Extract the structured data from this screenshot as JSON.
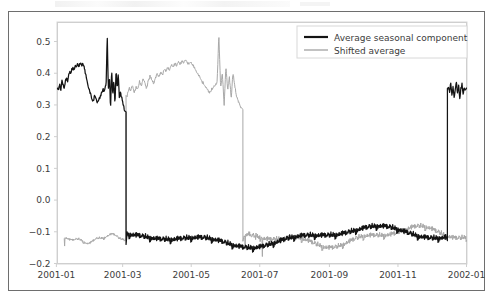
{
  "figure": {
    "background_color": "#ffffff",
    "frame_color": "#6e6e6e",
    "axes_spine_color": "#cfcfcf"
  },
  "chart_data": {
    "type": "line",
    "title": "",
    "subtitle": "",
    "xlabel": "",
    "ylabel": "",
    "grid": false,
    "legend_position": "upper right",
    "xlim": [
      "2000-12-24",
      "2002-01-07"
    ],
    "ylim": [
      -0.2,
      0.56
    ],
    "yticks": [
      -0.2,
      -0.1,
      0.0,
      0.1,
      0.2,
      0.3,
      0.4,
      0.5
    ],
    "ytick_labels": [
      "-0.2",
      "-0.1",
      "0.0",
      "0.1",
      "0.2",
      "0.3",
      "0.4",
      "0.5"
    ],
    "xticks": [
      "2001-01",
      "2001-03",
      "2001-05",
      "2001-07",
      "2001-09",
      "2001-11",
      "2002-01"
    ],
    "xtick_labels": [
      "2001-01",
      "2001-03",
      "2001-05",
      "2001-07",
      "2001-09",
      "2001-11",
      "2002-01"
    ],
    "x_unit": "day-of-year-2001",
    "x_start_day": 2,
    "x_end_day": 366,
    "series": [
      {
        "name": "Average seasonal component",
        "color": "#141414",
        "linewidth": 1.25,
        "description": "High regime ~0.31-0.52 from 2001-01 through early 2001-03, abrupt drop to low regime ~-0.12 through mid 2001-12, then abrupt jump back to ~0.32-0.37 to end of series.",
        "segments": [
          {
            "regime": "high",
            "from_day": 2,
            "to_day": 62,
            "mean": 0.375,
            "min": 0.28,
            "max": 0.52,
            "values": [
              0.355,
              0.352,
              0.368,
              0.345,
              0.378,
              0.362,
              0.349,
              0.372,
              0.386,
              0.37,
              0.392,
              0.405,
              0.398,
              0.412,
              0.42,
              0.408,
              0.425,
              0.418,
              0.43,
              0.422,
              0.427,
              0.431,
              0.424,
              0.43,
              0.419,
              0.402,
              0.388,
              0.371,
              0.356,
              0.344,
              0.332,
              0.318,
              0.311,
              0.32,
              0.328,
              0.318,
              0.306,
              0.313,
              0.322,
              0.331,
              0.339,
              0.348,
              0.342,
              0.352,
              0.365,
              0.52,
              0.345,
              0.392,
              0.285,
              0.41,
              0.33,
              0.378,
              0.3,
              0.412,
              0.352,
              0.395,
              0.318,
              0.34,
              0.322,
              0.308,
              0.292,
              0.278
            ]
          },
          {
            "regime": "transition-down",
            "at_day": 63,
            "from_value": 0.278,
            "to_value": -0.14
          },
          {
            "regime": "low",
            "from_day": 64,
            "to_day": 348,
            "mean": -0.118,
            "min": -0.175,
            "max": -0.068,
            "note": "noisy plateau, slightly rising toward -0.075 near 2001-09 then easing to -0.13"
          },
          {
            "regime": "transition-up",
            "at_day": 349,
            "from_value": -0.128,
            "to_value": 0.352
          },
          {
            "regime": "high-tail",
            "from_day": 350,
            "to_day": 366,
            "mean": 0.348,
            "min": 0.315,
            "max": 0.372,
            "values": [
              0.352,
              0.34,
              0.368,
              0.33,
              0.358,
              0.322,
              0.345,
              0.372,
              0.336,
              0.36,
              0.318,
              0.35,
              0.365,
              0.332,
              0.356,
              0.348,
              0.352
            ]
          }
        ]
      },
      {
        "name": "Shifted average",
        "color": "#a8a8a8",
        "linewidth": 1.0,
        "description": "Low regime ~-0.12 from 2001-01 to early 2001-03, jumps to high regime ~0.30-0.52 through mid 2001-06, then drops back to low regime ~-0.12 for the rest of the year.",
        "segments": [
          {
            "regime": "low",
            "from_day": 8,
            "to_day": 62,
            "mean": -0.123,
            "min": -0.145,
            "max": -0.098
          },
          {
            "regime": "transition-up",
            "at_day": 63,
            "from_value": -0.125,
            "to_value": 0.33
          },
          {
            "regime": "high",
            "from_day": 64,
            "to_day": 166,
            "mean": 0.385,
            "min": 0.285,
            "max": 0.52,
            "values": [
              0.33,
              0.352,
              0.345,
              0.362,
              0.338,
              0.355,
              0.348,
              0.372,
              0.36,
              0.382,
              0.368,
              0.352,
              0.375,
              0.39,
              0.378,
              0.368,
              0.385,
              0.398,
              0.388,
              0.402,
              0.395,
              0.412,
              0.404,
              0.418,
              0.41,
              0.425,
              0.418,
              0.43,
              0.422,
              0.436,
              0.428,
              0.44,
              0.432,
              0.442,
              0.434,
              0.428,
              0.436,
              0.425,
              0.418,
              0.408,
              0.398,
              0.388,
              0.378,
              0.368,
              0.36,
              0.352,
              0.345,
              0.34,
              0.348,
              0.356,
              0.362,
              0.37,
              0.52,
              0.352,
              0.398,
              0.3,
              0.42,
              0.345,
              0.388,
              0.318,
              0.402,
              0.36,
              0.33,
              0.312,
              0.298,
              0.285
            ]
          },
          {
            "regime": "transition-down",
            "at_day": 167,
            "from_value": 0.285,
            "to_value": -0.13
          },
          {
            "regime": "low-tail",
            "from_day": 168,
            "to_day": 366,
            "mean": -0.118,
            "min": -0.178,
            "max": -0.072
          }
        ]
      }
    ]
  },
  "legend": {
    "entries": [
      {
        "label": "Average seasonal component",
        "color": "#141414",
        "style": "thick-line"
      },
      {
        "label": "Shifted average",
        "color": "#a8a8a8",
        "style": "thin-line"
      }
    ]
  }
}
